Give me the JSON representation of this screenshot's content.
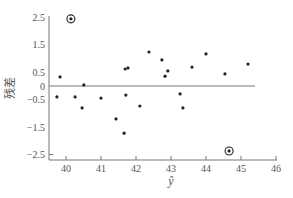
{
  "chart_data": {
    "type": "scatter",
    "title": "",
    "xlabel": "ŷ",
    "ylabel": "残差",
    "xlim": [
      39.5,
      46
    ],
    "ylim": [
      -2.5,
      2.5
    ],
    "x_ticks": [
      40,
      41,
      42,
      43,
      44,
      45,
      46
    ],
    "y_ticks": [
      2.5,
      1.5,
      0.5,
      0,
      -0.5,
      -1.5,
      -2.5
    ],
    "y_tick_labels": [
      "2.5",
      "1.5",
      "0.5",
      "0",
      "−0.5",
      "−1.5",
      "−2.5"
    ],
    "reference_line": {
      "y": 0
    },
    "grid": false,
    "legend": null,
    "points": [
      {
        "x": 40.14,
        "y": 2.45,
        "outlier": true
      },
      {
        "x": 39.83,
        "y": 0.33
      },
      {
        "x": 39.74,
        "y": -0.4
      },
      {
        "x": 40.26,
        "y": -0.4
      },
      {
        "x": 40.46,
        "y": -0.8
      },
      {
        "x": 40.51,
        "y": 0.04
      },
      {
        "x": 41.0,
        "y": -0.44
      },
      {
        "x": 41.43,
        "y": -1.2
      },
      {
        "x": 41.66,
        "y": -1.72
      },
      {
        "x": 41.71,
        "y": -0.33
      },
      {
        "x": 41.69,
        "y": 0.62
      },
      {
        "x": 41.77,
        "y": 0.66
      },
      {
        "x": 42.11,
        "y": -0.73
      },
      {
        "x": 42.37,
        "y": 1.24
      },
      {
        "x": 42.74,
        "y": 0.95
      },
      {
        "x": 42.91,
        "y": 0.55
      },
      {
        "x": 42.83,
        "y": 0.36
      },
      {
        "x": 43.26,
        "y": -0.29
      },
      {
        "x": 43.34,
        "y": -0.8
      },
      {
        "x": 43.6,
        "y": 0.69
      },
      {
        "x": 44.0,
        "y": 1.17
      },
      {
        "x": 44.54,
        "y": 0.44
      },
      {
        "x": 45.2,
        "y": 0.8
      },
      {
        "x": 44.66,
        "y": -2.37,
        "outlier": true
      }
    ]
  },
  "colors": {
    "axis": "#777777",
    "point": "#222222",
    "text": "#555555"
  }
}
